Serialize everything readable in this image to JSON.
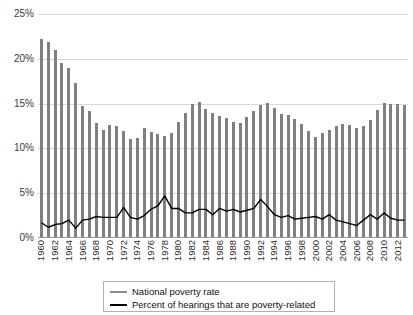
{
  "chart_data": {
    "type": "bar",
    "title": "",
    "xlabel": "",
    "ylabel": "",
    "ylim": [
      0,
      25
    ],
    "ytick_labels": [
      "0%",
      "5%",
      "10%",
      "15%",
      "20%",
      "25%"
    ],
    "ytick_values": [
      0,
      5,
      10,
      15,
      20,
      25
    ],
    "grid": true,
    "legend_position": "bottom-center",
    "x": [
      1960,
      1961,
      1962,
      1963,
      1964,
      1965,
      1966,
      1967,
      1968,
      1969,
      1970,
      1971,
      1972,
      1973,
      1974,
      1975,
      1976,
      1977,
      1978,
      1979,
      1980,
      1981,
      1982,
      1983,
      1984,
      1985,
      1986,
      1987,
      1988,
      1989,
      1990,
      1991,
      1992,
      1993,
      1994,
      1995,
      1996,
      1997,
      1998,
      1999,
      2000,
      2001,
      2002,
      2003,
      2004,
      2005,
      2006,
      2007,
      2008,
      2009,
      2010,
      2011,
      2012,
      2013
    ],
    "xtick_labels": [
      "1960",
      "1962",
      "1964",
      "1966",
      "1968",
      "1970",
      "1972",
      "1974",
      "1976",
      "1978",
      "1980",
      "1982",
      "1984",
      "1986",
      "1988",
      "1990",
      "1992",
      "1994",
      "1996",
      "1998",
      "2000",
      "2002",
      "2004",
      "2006",
      "2008",
      "2010",
      "2012"
    ],
    "series": [
      {
        "name": "National poverty rate",
        "render": "bar",
        "color": "#808080",
        "values": [
          22.2,
          21.9,
          21.0,
          19.5,
          19.0,
          17.3,
          14.7,
          14.2,
          12.8,
          12.1,
          12.6,
          12.5,
          11.9,
          11.1,
          11.2,
          12.3,
          11.8,
          11.6,
          11.4,
          11.7,
          13.0,
          14.0,
          15.0,
          15.2,
          14.4,
          14.0,
          13.6,
          13.4,
          13.0,
          12.8,
          13.5,
          14.2,
          14.8,
          15.1,
          14.5,
          13.8,
          13.7,
          13.3,
          12.7,
          11.9,
          11.3,
          11.7,
          12.1,
          12.5,
          12.7,
          12.6,
          12.3,
          12.5,
          13.2,
          14.3,
          15.1,
          15.0,
          15.0,
          14.8
        ]
      },
      {
        "name": "Percent of hearings that are poverty-related",
        "render": "line",
        "color": "#000000",
        "values": [
          1.7,
          1.2,
          1.5,
          1.6,
          2.0,
          1.1,
          2.0,
          2.1,
          2.4,
          2.3,
          2.3,
          2.3,
          3.4,
          2.3,
          2.1,
          2.5,
          3.2,
          3.6,
          4.7,
          3.3,
          3.3,
          2.8,
          2.8,
          3.2,
          3.2,
          2.6,
          3.3,
          3.0,
          3.2,
          2.9,
          3.1,
          3.3,
          4.3,
          3.5,
          2.6,
          2.3,
          2.5,
          2.1,
          2.2,
          2.3,
          2.4,
          2.1,
          2.6,
          2.0,
          1.8,
          1.6,
          1.4,
          2.0,
          2.6,
          2.1,
          2.8,
          2.2,
          2.0,
          2.0
        ]
      }
    ]
  },
  "legend": {
    "items": [
      {
        "label": "National poverty rate",
        "color": "#8c8c8c"
      },
      {
        "label": "Percent of hearings that are poverty-related",
        "color": "#000000"
      }
    ]
  }
}
